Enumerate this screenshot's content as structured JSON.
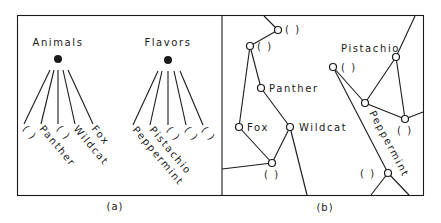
{
  "panel_a": {
    "caption": "(a)",
    "groups": [
      {
        "title": "Animals",
        "leaves": [
          "(  )",
          "Panther",
          "(  )",
          "Wildcat",
          "Fox"
        ]
      },
      {
        "title": "Flavors",
        "leaves": [
          "Peppermint",
          "Pistachio",
          "(  )",
          "(  )",
          "(  )"
        ]
      }
    ]
  },
  "panel_b": {
    "caption": "(b)",
    "node_labels": {
      "n1": "(  )",
      "n2": "(  )",
      "panther": "Panther",
      "fox": "Fox",
      "wildcat": "Wildcat",
      "n6": "(  )",
      "pistachio": "Pistachio",
      "n8": "(  )",
      "n10": "(  )",
      "peppermint": "Peppermint",
      "n11": "(  )"
    }
  },
  "colors": {
    "ink": "#1a1a1a",
    "paper": "#ffffff"
  }
}
